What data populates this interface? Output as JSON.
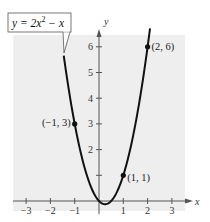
{
  "chart_data": {
    "type": "line",
    "title": "",
    "equation_label": "y = 2x² − x",
    "equation_parts": {
      "lhs": "y = 2x",
      "exp": "2",
      "rhs": " − x"
    },
    "xlabel": "x",
    "ylabel": "y",
    "xlim": [
      -3.5,
      3.5
    ],
    "ylim": [
      -0.3,
      6.5
    ],
    "x_ticks": [
      -3,
      -2,
      -1,
      1,
      2,
      3
    ],
    "x_tick_labels": [
      "−3",
      "−2",
      "−1",
      "1",
      "2",
      "3"
    ],
    "y_ticks": [
      1,
      2,
      3,
      4,
      5,
      6
    ],
    "y_tick_labels": [
      "",
      "2",
      "3",
      "4",
      "5",
      "6"
    ],
    "grid": false,
    "background_color": "#eeeeee",
    "curve_color": "#111111",
    "series": [
      {
        "name": "y = 2x^2 - x",
        "function": "2*x*x - x",
        "x_range": [
          -1.45,
          2.1
        ]
      }
    ],
    "points": [
      {
        "x": -1,
        "y": 3,
        "label": "(−1, 3)"
      },
      {
        "x": 1,
        "y": 1,
        "label": "(1, 1)"
      },
      {
        "x": 2,
        "y": 6,
        "label": "(2, 6)"
      }
    ]
  }
}
